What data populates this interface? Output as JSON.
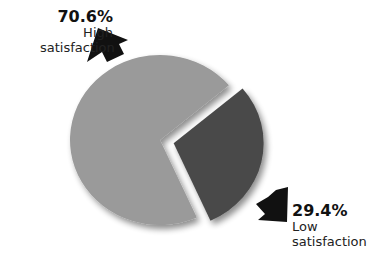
{
  "chart_data": {
    "type": "pie",
    "title": "",
    "slices": [
      {
        "label": "High satisfaction",
        "value": 70.6,
        "display": "70.6%",
        "color": "#9a9a9a",
        "exploded": false
      },
      {
        "label": "Low satisfaction",
        "value": 29.4,
        "display": "29.4%",
        "color": "#4a4a4a",
        "exploded": true
      }
    ],
    "legend": "none",
    "annotations": [
      "70.6% High satisfaction",
      "29.4% Low satisfaction"
    ]
  },
  "labels": {
    "high": {
      "pct": "70.6%",
      "line1": "High",
      "line2": "satisfaction"
    },
    "low": {
      "pct": "29.4%",
      "line1": "Low",
      "line2": "satisfaction"
    }
  }
}
